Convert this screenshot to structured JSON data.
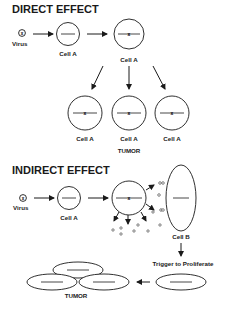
{
  "direct": {
    "title": "DIRECT EFFECT",
    "virus_label": "Virus",
    "virus_symbol": "x",
    "cell1_label": "Cell A",
    "cell2_label": "Cell A",
    "daughter_labels": [
      "Cell A",
      "Cell A",
      "Cell A"
    ],
    "tumor_label": "TUMOR"
  },
  "indirect": {
    "title": "INDIRECT EFFECT",
    "virus_label": "Virus",
    "virus_symbol": "x",
    "cell1_label": "Cell A",
    "cellB_label": "Cell B",
    "trigger_label": "Trigger to Proliferate",
    "tumor_label": "TUMOR"
  },
  "colors": {
    "ink": "#1a1a1a",
    "background": "#ffffff"
  }
}
